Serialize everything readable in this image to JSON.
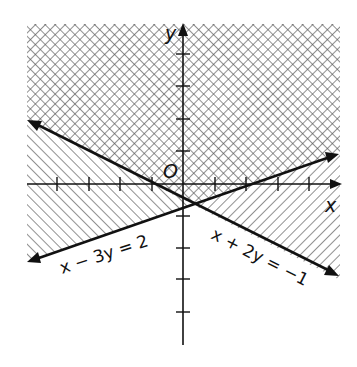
{
  "figure": {
    "type": "inequality-graph",
    "axes": {
      "x_label": "x",
      "y_label": "y",
      "origin_label": "O",
      "x_ticks": [
        -4,
        -3,
        -2,
        -1,
        1,
        2,
        3,
        4
      ],
      "y_ticks": [
        -5,
        -4,
        -3,
        -2,
        -1,
        1,
        2,
        3,
        4
      ]
    },
    "lines": [
      {
        "id": "line1",
        "equation": "x + 2y = −1",
        "slope": -0.5,
        "intercept_y": -0.5
      },
      {
        "id": "line2",
        "equation": "x − 3y = 2",
        "slope": 0.3333,
        "intercept_y": -0.6667
      }
    ],
    "regions": [
      {
        "name": "above x+2y=-1",
        "pattern": "diagonal-hatch-down"
      },
      {
        "name": "above x-3y=2",
        "pattern": "diagonal-hatch-up"
      },
      {
        "name": "overlap (solution)",
        "pattern": "crosshatch"
      }
    ],
    "intersection": {
      "x": 0.2,
      "y": -0.6
    },
    "colors": {
      "ink": "#111111",
      "hatch": "#555555",
      "background": "#ffffff"
    }
  }
}
